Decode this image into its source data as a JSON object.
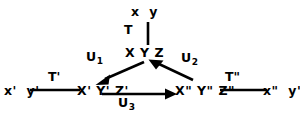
{
  "diagram": {
    "type": "commutative-diagram",
    "background_color": "#ffffff",
    "stroke_color": "#000000",
    "text_color": "#000000",
    "nodes": [
      {
        "id": "top",
        "label": "x  y",
        "x": 148,
        "y": 12
      },
      {
        "id": "center",
        "label": "X Y Z",
        "x": 148,
        "y": 53
      },
      {
        "id": "left_outer",
        "label": "x'  y'",
        "x": 22,
        "y": 92
      },
      {
        "id": "left_inner",
        "label": "X' Y' Z'",
        "x": 99,
        "y": 92
      },
      {
        "id": "right_inner",
        "label": "X\" Y\" Z\"",
        "x": 197,
        "y": 92
      },
      {
        "id": "right_outer",
        "label": "x\"  y\"",
        "x": 276,
        "y": 92
      }
    ],
    "edges": [
      {
        "id": "edge_T",
        "label": "T",
        "subscript": "",
        "from": "top",
        "to": "center",
        "arrow": "none",
        "label_x": 131,
        "label_y": 29
      },
      {
        "id": "edge_U1",
        "label": "U",
        "subscript": "1",
        "from": "center",
        "to": "left_inner",
        "arrow": "to",
        "label_x": 91,
        "label_y": 57
      },
      {
        "id": "edge_U2",
        "label": "U",
        "subscript": "2",
        "from": "right_inner",
        "to": "center",
        "arrow": "to",
        "label_x": 186,
        "label_y": 58
      },
      {
        "id": "edge_U3",
        "label": "U",
        "subscript": "3",
        "from": "left_inner",
        "to": "right_inner",
        "arrow": "to",
        "label_x": 123,
        "label_y": 103
      },
      {
        "id": "edge_Tp",
        "label": "T'",
        "subscript": "",
        "from": "left_outer",
        "to": "left_inner",
        "arrow": "none",
        "label_x": 53,
        "label_y": 76
      },
      {
        "id": "edge_Tpp",
        "label": "T\"",
        "subscript": "",
        "from": "right_inner",
        "to": "right_outer",
        "arrow": "none",
        "label_x": 231,
        "label_y": 76
      }
    ]
  }
}
